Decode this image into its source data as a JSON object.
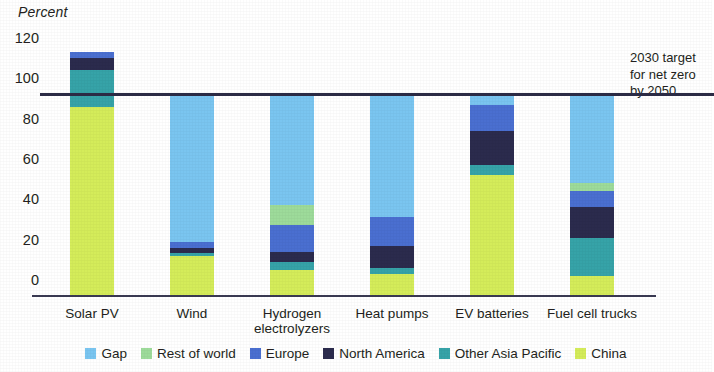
{
  "chart_data": {
    "type": "bar",
    "stacked": true,
    "title": "",
    "xlabel": "",
    "ylabel": "Percent",
    "ylim": [
      0,
      130
    ],
    "yticks": [
      0,
      20,
      40,
      60,
      80,
      100,
      120
    ],
    "grid": false,
    "legend_position": "bottom",
    "categories": [
      "Solar PV",
      "Wind",
      "Hydrogen electrolyzers",
      "Heat pumps",
      "EV batteries",
      "Fuel cell trucks"
    ],
    "category_labels": [
      [
        "Solar PV"
      ],
      [
        "Wind"
      ],
      [
        "Hydrogen",
        "electrolyzers"
      ],
      [
        "Heat pumps"
      ],
      [
        "EV batteries"
      ],
      [
        "Fuel cell trucks"
      ]
    ],
    "series": [
      {
        "name": "China",
        "color": "#d4ec5a",
        "values": [
          94,
          20,
          13,
          11,
          60,
          10
        ]
      },
      {
        "name": "Other Asia Pacific",
        "color": "#36a3a8",
        "values": [
          18,
          1.5,
          4,
          3,
          5,
          19
        ]
      },
      {
        "name": "North America",
        "color": "#2b2b4d",
        "values": [
          6,
          2.5,
          5,
          11,
          17,
          15
        ]
      },
      {
        "name": "Europe",
        "color": "#4a6fd0",
        "values": [
          3,
          3,
          13,
          14,
          13,
          8
        ]
      },
      {
        "name": "Rest of world",
        "color": "#9ddb9a",
        "values": [
          0,
          0,
          10,
          0,
          0,
          4
        ]
      },
      {
        "name": "Gap",
        "color": "#7ac5f0",
        "values": [
          0,
          73,
          55,
          61,
          5,
          44
        ]
      }
    ],
    "stack_order_bottom_to_top": [
      "China",
      "Other Asia Pacific",
      "North America",
      "Europe",
      "Rest of world",
      "Gap"
    ],
    "totals": [
      121,
      100,
      100,
      100,
      100,
      100
    ],
    "reference_line": {
      "value": 100,
      "color": "#2b2b45"
    },
    "annotation": {
      "lines": [
        "2030 target",
        "for net zero",
        "by 2050"
      ]
    }
  },
  "legend": {
    "items": [
      {
        "label": "Gap",
        "color": "#7ac5f0"
      },
      {
        "label": "Rest of world",
        "color": "#9ddb9a"
      },
      {
        "label": "Europe",
        "color": "#4a6fd0"
      },
      {
        "label": "North America",
        "color": "#2b2b4d"
      },
      {
        "label": "Other Asia Pacific",
        "color": "#36a3a8"
      },
      {
        "label": "China",
        "color": "#d4ec5a"
      }
    ]
  }
}
